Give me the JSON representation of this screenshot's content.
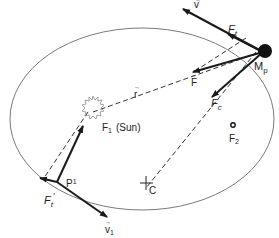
{
  "diagram": {
    "labels": {
      "v": "v",
      "Ft": "F",
      "Ft_sub": "t",
      "Mp": "M",
      "Mp_sub": "p",
      "r": "r",
      "F": "F",
      "Fc": "F",
      "Fc_sub": "c",
      "F1": "F",
      "F1_sub": "1",
      "sun": "(Sun)",
      "F2": "F",
      "F2_sub": "2",
      "C": "C",
      "P1": "P",
      "P1_sup": "1",
      "Ft1": "F",
      "Ft1_sub": "t",
      "Ft1_sup": "′",
      "v1": "v",
      "v1_sub": "1"
    },
    "colors": {
      "ellipse": "#7a7a7a",
      "vector": "#1a1a1a",
      "dashed": "#333333",
      "planet": "#111111"
    }
  }
}
